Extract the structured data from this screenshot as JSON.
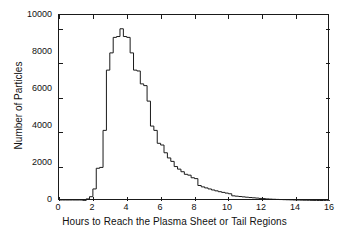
{
  "chart_data": {
    "type": "bar",
    "title": "",
    "xlabel": "Hours to Reach the Plasma Sheet or Tail Regions",
    "ylabel": "Number of Particles",
    "xlim": [
      0,
      16
    ],
    "ylim": [
      0,
      10800
    ],
    "xticks": [
      0,
      2,
      4,
      6,
      8,
      10,
      12,
      14,
      16
    ],
    "yticks": [
      0,
      2000,
      4000,
      6000,
      8000,
      10000
    ],
    "xtick_labels": [
      "0",
      "2",
      "4",
      "6",
      "8",
      "10",
      "12",
      "14",
      "16"
    ],
    "ytick_labels": [
      "0",
      "2000",
      "4000",
      "6000",
      "8000",
      "10000"
    ],
    "grid": false,
    "legend": null,
    "bin_width": 0.2,
    "histogram_style": "step-outline",
    "line_color": "#1a1a1a",
    "bin_centers": [
      0.1,
      0.3,
      0.5,
      0.7,
      0.9,
      1.1,
      1.3,
      1.5,
      1.7,
      1.9,
      2.1,
      2.3,
      2.5,
      2.7,
      2.9,
      3.1,
      3.3,
      3.5,
      3.7,
      3.9,
      4.1,
      4.3,
      4.5,
      4.7,
      4.9,
      5.1,
      5.3,
      5.5,
      5.7,
      5.9,
      6.1,
      6.3,
      6.5,
      6.7,
      6.9,
      7.1,
      7.3,
      7.5,
      7.7,
      7.9,
      8.1,
      8.3,
      8.5,
      8.7,
      8.9,
      9.1,
      9.3,
      9.5,
      9.7,
      9.9,
      10.1,
      10.3,
      10.5,
      10.7,
      10.9,
      11.1,
      11.3,
      11.5,
      11.7,
      11.9,
      12.1,
      12.3,
      12.5,
      12.7,
      12.9,
      13.1,
      13.3,
      13.5,
      13.7,
      13.9,
      14.1,
      14.3,
      14.5,
      14.7,
      14.9,
      15.1,
      15.3,
      15.5,
      15.7,
      15.9
    ],
    "values": [
      0,
      0,
      0,
      0,
      0,
      0,
      0,
      20,
      120,
      250,
      700,
      1900,
      1950,
      4100,
      7600,
      8600,
      9500,
      9550,
      10000,
      9550,
      9500,
      8600,
      7600,
      7550,
      6800,
      6700,
      5800,
      4350,
      4100,
      3350,
      3250,
      2800,
      2500,
      2300,
      2000,
      1850,
      1700,
      1550,
      1500,
      1350,
      1300,
      900,
      820,
      760,
      700,
      640,
      590,
      540,
      500,
      460,
      420,
      300,
      280,
      260,
      240,
      220,
      200,
      185,
      170,
      150,
      140,
      120,
      110,
      100,
      92,
      85,
      78,
      72,
      66,
      60,
      55,
      50,
      46,
      42,
      38,
      34,
      30,
      27,
      24,
      20
    ],
    "annotation": {
      "lines": [
        "April 6, 2000, 10:50-20:50 UT",
        "Mean: 4.82 h",
        "Median: 4.31 h",
        "Stddev: 1.98 h"
      ],
      "position": "top-right"
    }
  }
}
